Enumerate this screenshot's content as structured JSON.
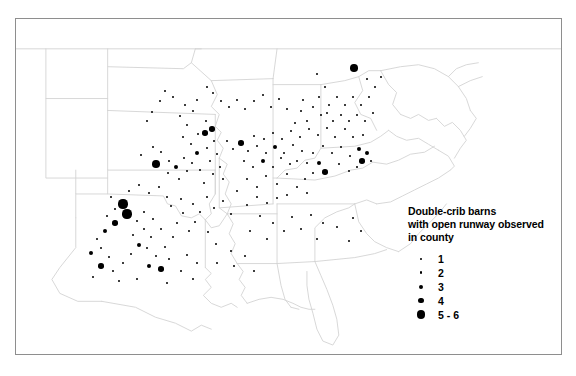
{
  "figure": {
    "type": "map",
    "subject": "Double-crib barns with open runway observed in county",
    "region": "Eastern and central United States"
  },
  "legend": {
    "title": "Double-crib barns\nwith open runway observed\nin county",
    "title_lines": [
      "Double-crib barns",
      "with open runway observed",
      "in county"
    ],
    "items": [
      {
        "label": "1",
        "size_px": 1.8
      },
      {
        "label": "2",
        "size_px": 2.8
      },
      {
        "label": "3",
        "size_px": 4.0
      },
      {
        "label": "4",
        "size_px": 5.2
      },
      {
        "label": "5 - 6",
        "size_px": 8.4
      }
    ]
  },
  "style": {
    "frame_color": "#8e8e8e",
    "state_border_color": "#d2d2d2",
    "coastline_color": "#c8c8c8",
    "dot_color": "#000000",
    "background": "#ffffff"
  },
  "chart_data": {
    "type": "scatter",
    "title": "Double-crib barns with open runway observed in county",
    "xlabel": "",
    "ylabel": "",
    "value_classes": [
      1,
      2,
      3,
      4,
      "5 - 6"
    ],
    "note": "Each point is a county; point size encodes the count of double-crib barns with open runway observed.",
    "points": [
      {
        "x": 140.0,
        "y": 154.0,
        "v": 1
      },
      {
        "x": 152.0,
        "y": 146.0,
        "v": 1
      },
      {
        "x": 160.0,
        "y": 151.0,
        "v": 2
      },
      {
        "x": 155.0,
        "y": 163.0,
        "v": 5
      },
      {
        "x": 168.0,
        "y": 160.0,
        "v": 1
      },
      {
        "x": 175.0,
        "y": 166.0,
        "v": 3
      },
      {
        "x": 167.0,
        "y": 172.0,
        "v": 2
      },
      {
        "x": 178.0,
        "y": 178.0,
        "v": 2
      },
      {
        "x": 186.0,
        "y": 170.0,
        "v": 1
      },
      {
        "x": 191.0,
        "y": 162.0,
        "v": 1
      },
      {
        "x": 183.0,
        "y": 157.0,
        "v": 2
      },
      {
        "x": 196.0,
        "y": 152.0,
        "v": 3
      },
      {
        "x": 190.0,
        "y": 143.0,
        "v": 2
      },
      {
        "x": 182.0,
        "y": 136.0,
        "v": 1
      },
      {
        "x": 197.0,
        "y": 133.0,
        "v": 2
      },
      {
        "x": 186.0,
        "y": 124.0,
        "v": 2
      },
      {
        "x": 179.0,
        "y": 115.0,
        "v": 1
      },
      {
        "x": 192.0,
        "y": 110.0,
        "v": 1
      },
      {
        "x": 184.0,
        "y": 104.0,
        "v": 1
      },
      {
        "x": 196.0,
        "y": 99.0,
        "v": 2
      },
      {
        "x": 205.0,
        "y": 120.0,
        "v": 2
      },
      {
        "x": 211.0,
        "y": 128.0,
        "v": 4
      },
      {
        "x": 204.0,
        "y": 132.0,
        "v": 4
      },
      {
        "x": 213.0,
        "y": 140.0,
        "v": 1
      },
      {
        "x": 206.0,
        "y": 147.0,
        "v": 2
      },
      {
        "x": 216.0,
        "y": 153.0,
        "v": 1
      },
      {
        "x": 209.0,
        "y": 160.0,
        "v": 1
      },
      {
        "x": 219.0,
        "y": 166.0,
        "v": 1
      },
      {
        "x": 212.0,
        "y": 173.0,
        "v": 1
      },
      {
        "x": 222.0,
        "y": 178.0,
        "v": 1
      },
      {
        "x": 199.0,
        "y": 169.0,
        "v": 1
      },
      {
        "x": 203.0,
        "y": 182.0,
        "v": 1
      },
      {
        "x": 172.0,
        "y": 96.0,
        "v": 1
      },
      {
        "x": 164.0,
        "y": 90.0,
        "v": 1
      },
      {
        "x": 159.0,
        "y": 100.0,
        "v": 1
      },
      {
        "x": 151.0,
        "y": 111.0,
        "v": 1
      },
      {
        "x": 146.0,
        "y": 120.0,
        "v": 1
      },
      {
        "x": 122.0,
        "y": 203.0,
        "v": 6
      },
      {
        "x": 126.0,
        "y": 213.0,
        "v": 6
      },
      {
        "x": 114.0,
        "y": 222.0,
        "v": 4
      },
      {
        "x": 104.0,
        "y": 230.0,
        "v": 3
      },
      {
        "x": 96.0,
        "y": 238.0,
        "v": 2
      },
      {
        "x": 90.0,
        "y": 252.0,
        "v": 3
      },
      {
        "x": 100.0,
        "y": 247.0,
        "v": 2
      },
      {
        "x": 108.0,
        "y": 256.0,
        "v": 2
      },
      {
        "x": 100.0,
        "y": 265.0,
        "v": 4
      },
      {
        "x": 112.0,
        "y": 270.0,
        "v": 1
      },
      {
        "x": 122.0,
        "y": 262.0,
        "v": 1
      },
      {
        "x": 130.0,
        "y": 253.0,
        "v": 2
      },
      {
        "x": 138.0,
        "y": 244.0,
        "v": 3
      },
      {
        "x": 132.0,
        "y": 234.0,
        "v": 2
      },
      {
        "x": 143.0,
        "y": 228.0,
        "v": 1
      },
      {
        "x": 150.0,
        "y": 236.0,
        "v": 2
      },
      {
        "x": 146.0,
        "y": 247.0,
        "v": 2
      },
      {
        "x": 155.0,
        "y": 255.0,
        "v": 1
      },
      {
        "x": 148.0,
        "y": 265.0,
        "v": 3
      },
      {
        "x": 160.0,
        "y": 268.0,
        "v": 4
      },
      {
        "x": 168.0,
        "y": 258.0,
        "v": 1
      },
      {
        "x": 164.0,
        "y": 246.0,
        "v": 2
      },
      {
        "x": 172.0,
        "y": 236.0,
        "v": 2
      },
      {
        "x": 160.0,
        "y": 228.0,
        "v": 1
      },
      {
        "x": 152.0,
        "y": 218.0,
        "v": 1
      },
      {
        "x": 143.0,
        "y": 211.0,
        "v": 1
      },
      {
        "x": 136.0,
        "y": 220.0,
        "v": 1
      },
      {
        "x": 176.0,
        "y": 222.0,
        "v": 1
      },
      {
        "x": 182.0,
        "y": 212.0,
        "v": 2
      },
      {
        "x": 188.0,
        "y": 230.0,
        "v": 1
      },
      {
        "x": 194.0,
        "y": 221.0,
        "v": 1
      },
      {
        "x": 170.0,
        "y": 205.0,
        "v": 2
      },
      {
        "x": 180.0,
        "y": 198.0,
        "v": 1
      },
      {
        "x": 192.0,
        "y": 203.0,
        "v": 1
      },
      {
        "x": 199.0,
        "y": 211.0,
        "v": 1
      },
      {
        "x": 206.0,
        "y": 196.0,
        "v": 1
      },
      {
        "x": 213.0,
        "y": 207.0,
        "v": 1
      },
      {
        "x": 222.0,
        "y": 200.0,
        "v": 1
      },
      {
        "x": 207.0,
        "y": 231.0,
        "v": 1
      },
      {
        "x": 230.0,
        "y": 213.0,
        "v": 1
      },
      {
        "x": 215.0,
        "y": 243.0,
        "v": 1
      },
      {
        "x": 230.0,
        "y": 250.0,
        "v": 1
      },
      {
        "x": 216.0,
        "y": 262.0,
        "v": 1
      },
      {
        "x": 233.0,
        "y": 265.0,
        "v": 1
      },
      {
        "x": 244.0,
        "y": 255.0,
        "v": 1
      },
      {
        "x": 253.0,
        "y": 270.0,
        "v": 1
      },
      {
        "x": 249.0,
        "y": 230.0,
        "v": 1
      },
      {
        "x": 259.0,
        "y": 215.0,
        "v": 1
      },
      {
        "x": 266.0,
        "y": 238.0,
        "v": 1
      },
      {
        "x": 272.0,
        "y": 222.0,
        "v": 1
      },
      {
        "x": 283.0,
        "y": 230.0,
        "v": 1
      },
      {
        "x": 291.0,
        "y": 216.0,
        "v": 1
      },
      {
        "x": 300.0,
        "y": 228.0,
        "v": 1
      },
      {
        "x": 310.0,
        "y": 214.0,
        "v": 1
      },
      {
        "x": 322.0,
        "y": 222.0,
        "v": 1
      },
      {
        "x": 316.0,
        "y": 238.0,
        "v": 1
      },
      {
        "x": 336.0,
        "y": 226.0,
        "v": 1
      },
      {
        "x": 348.0,
        "y": 240.0,
        "v": 1
      },
      {
        "x": 352.0,
        "y": 217.0,
        "v": 1
      },
      {
        "x": 360.0,
        "y": 230.0,
        "v": 1
      },
      {
        "x": 246.0,
        "y": 178.0,
        "v": 1
      },
      {
        "x": 256.0,
        "y": 186.0,
        "v": 1
      },
      {
        "x": 265.0,
        "y": 175.0,
        "v": 1
      },
      {
        "x": 276.0,
        "y": 183.0,
        "v": 1
      },
      {
        "x": 286.0,
        "y": 173.0,
        "v": 1
      },
      {
        "x": 252.0,
        "y": 166.0,
        "v": 2
      },
      {
        "x": 262.0,
        "y": 160.0,
        "v": 3
      },
      {
        "x": 272.0,
        "y": 166.0,
        "v": 2
      },
      {
        "x": 280.0,
        "y": 157.0,
        "v": 2
      },
      {
        "x": 289.0,
        "y": 163.0,
        "v": 1
      },
      {
        "x": 243.0,
        "y": 160.0,
        "v": 1
      },
      {
        "x": 247.0,
        "y": 150.0,
        "v": 1
      },
      {
        "x": 256.0,
        "y": 145.0,
        "v": 2
      },
      {
        "x": 265.0,
        "y": 152.0,
        "v": 2
      },
      {
        "x": 274.0,
        "y": 146.0,
        "v": 3
      },
      {
        "x": 283.0,
        "y": 152.0,
        "v": 2
      },
      {
        "x": 292.0,
        "y": 144.0,
        "v": 2
      },
      {
        "x": 301.0,
        "y": 150.0,
        "v": 2
      },
      {
        "x": 296.0,
        "y": 160.0,
        "v": 1
      },
      {
        "x": 306.0,
        "y": 162.0,
        "v": 1
      },
      {
        "x": 312.0,
        "y": 152.0,
        "v": 2
      },
      {
        "x": 318.0,
        "y": 162.0,
        "v": 3
      },
      {
        "x": 324.0,
        "y": 171.0,
        "v": 4
      },
      {
        "x": 312.0,
        "y": 172.0,
        "v": 1
      },
      {
        "x": 304.0,
        "y": 178.0,
        "v": 1
      },
      {
        "x": 296.0,
        "y": 186.0,
        "v": 1
      },
      {
        "x": 306.0,
        "y": 192.0,
        "v": 1
      },
      {
        "x": 286.0,
        "y": 194.0,
        "v": 1
      },
      {
        "x": 276.0,
        "y": 197.0,
        "v": 1
      },
      {
        "x": 266.0,
        "y": 202.0,
        "v": 1
      },
      {
        "x": 256.0,
        "y": 196.0,
        "v": 1
      },
      {
        "x": 246.0,
        "y": 204.0,
        "v": 1
      },
      {
        "x": 236.0,
        "y": 190.0,
        "v": 1
      },
      {
        "x": 240.0,
        "y": 142.0,
        "v": 4
      },
      {
        "x": 232.0,
        "y": 148.0,
        "v": 1
      },
      {
        "x": 226.0,
        "y": 140.0,
        "v": 1
      },
      {
        "x": 253.0,
        "y": 135.0,
        "v": 1
      },
      {
        "x": 263.0,
        "y": 138.0,
        "v": 1
      },
      {
        "x": 272.0,
        "y": 132.0,
        "v": 1
      },
      {
        "x": 281.0,
        "y": 138.0,
        "v": 1
      },
      {
        "x": 290.0,
        "y": 130.0,
        "v": 1
      },
      {
        "x": 299.0,
        "y": 136.0,
        "v": 1
      },
      {
        "x": 308.0,
        "y": 128.0,
        "v": 1
      },
      {
        "x": 317.0,
        "y": 134.0,
        "v": 1
      },
      {
        "x": 326.0,
        "y": 127.0,
        "v": 1
      },
      {
        "x": 334.0,
        "y": 136.0,
        "v": 1
      },
      {
        "x": 322.0,
        "y": 145.0,
        "v": 2
      },
      {
        "x": 331.0,
        "y": 152.0,
        "v": 2
      },
      {
        "x": 340.0,
        "y": 146.0,
        "v": 1
      },
      {
        "x": 349.0,
        "y": 155.0,
        "v": 1
      },
      {
        "x": 358.0,
        "y": 148.0,
        "v": 3
      },
      {
        "x": 366.0,
        "y": 152.0,
        "v": 3
      },
      {
        "x": 361.0,
        "y": 160.0,
        "v": 4
      },
      {
        "x": 370.0,
        "y": 160.0,
        "v": 2
      },
      {
        "x": 356.0,
        "y": 166.0,
        "v": 1
      },
      {
        "x": 348.0,
        "y": 170.0,
        "v": 1
      },
      {
        "x": 338.0,
        "y": 163.0,
        "v": 1
      },
      {
        "x": 344.0,
        "y": 128.0,
        "v": 1
      },
      {
        "x": 352.0,
        "y": 136.0,
        "v": 1
      },
      {
        "x": 362.0,
        "y": 134.0,
        "v": 1
      },
      {
        "x": 353.0,
        "y": 67.0,
        "v": 5
      },
      {
        "x": 316.0,
        "y": 73.0,
        "v": 1
      },
      {
        "x": 324.0,
        "y": 86.0,
        "v": 1
      },
      {
        "x": 318.0,
        "y": 96.0,
        "v": 1
      },
      {
        "x": 312.0,
        "y": 106.0,
        "v": 1
      },
      {
        "x": 320.0,
        "y": 114.0,
        "v": 1
      },
      {
        "x": 328.0,
        "y": 104.0,
        "v": 1
      },
      {
        "x": 336.0,
        "y": 96.0,
        "v": 1
      },
      {
        "x": 344.0,
        "y": 104.0,
        "v": 1
      },
      {
        "x": 352.0,
        "y": 96.0,
        "v": 1
      },
      {
        "x": 360.0,
        "y": 104.0,
        "v": 1
      },
      {
        "x": 368.0,
        "y": 96.0,
        "v": 1
      },
      {
        "x": 374.0,
        "y": 86.0,
        "v": 1
      },
      {
        "x": 366.0,
        "y": 78.0,
        "v": 1
      },
      {
        "x": 380.0,
        "y": 76.0,
        "v": 1
      },
      {
        "x": 372.0,
        "y": 112.0,
        "v": 1
      },
      {
        "x": 364.0,
        "y": 120.0,
        "v": 1
      },
      {
        "x": 356.0,
        "y": 114.0,
        "v": 1
      },
      {
        "x": 348.0,
        "y": 120.0,
        "v": 1
      },
      {
        "x": 340.0,
        "y": 114.0,
        "v": 1
      },
      {
        "x": 332.0,
        "y": 120.0,
        "v": 1
      },
      {
        "x": 326.0,
        "y": 112.0,
        "v": 1
      },
      {
        "x": 300.0,
        "y": 110.0,
        "v": 1
      },
      {
        "x": 306.0,
        "y": 120.0,
        "v": 1
      },
      {
        "x": 294.0,
        "y": 122.0,
        "v": 1
      },
      {
        "x": 302.0,
        "y": 99.0,
        "v": 1
      },
      {
        "x": 236.0,
        "y": 99.0,
        "v": 1
      },
      {
        "x": 228.0,
        "y": 106.0,
        "v": 1
      },
      {
        "x": 244.0,
        "y": 108.0,
        "v": 1
      },
      {
        "x": 212.0,
        "y": 92.0,
        "v": 2
      },
      {
        "x": 220.0,
        "y": 100.0,
        "v": 1
      },
      {
        "x": 206.0,
        "y": 86.0,
        "v": 1
      },
      {
        "x": 253.0,
        "y": 100.0,
        "v": 1
      },
      {
        "x": 262.0,
        "y": 94.0,
        "v": 1
      },
      {
        "x": 270.0,
        "y": 106.0,
        "v": 1
      },
      {
        "x": 278.0,
        "y": 98.0,
        "v": 1
      },
      {
        "x": 286.0,
        "y": 108.0,
        "v": 1
      },
      {
        "x": 92.0,
        "y": 276.0,
        "v": 1
      },
      {
        "x": 118.0,
        "y": 280.0,
        "v": 1
      },
      {
        "x": 136.0,
        "y": 278.0,
        "v": 1
      },
      {
        "x": 166.0,
        "y": 282.0,
        "v": 1
      },
      {
        "x": 186.0,
        "y": 254.0,
        "v": 1
      },
      {
        "x": 196.0,
        "y": 262.0,
        "v": 1
      },
      {
        "x": 180.0,
        "y": 270.0,
        "v": 1
      },
      {
        "x": 192.0,
        "y": 278.0,
        "v": 1
      },
      {
        "x": 128.0,
        "y": 190.0,
        "v": 1
      },
      {
        "x": 138.0,
        "y": 184.0,
        "v": 1
      },
      {
        "x": 148.0,
        "y": 192.0,
        "v": 1
      },
      {
        "x": 158.0,
        "y": 186.0,
        "v": 1
      },
      {
        "x": 166.0,
        "y": 196.0,
        "v": 1
      },
      {
        "x": 110.0,
        "y": 196.0,
        "v": 1
      },
      {
        "x": 114.0,
        "y": 208.0,
        "v": 1
      },
      {
        "x": 106.0,
        "y": 215.0,
        "v": 1
      }
    ]
  }
}
